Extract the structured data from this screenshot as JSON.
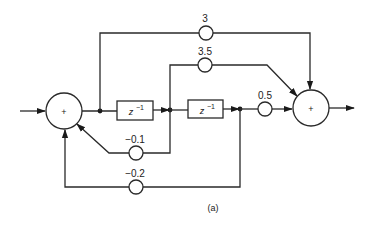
{
  "diagram": {
    "caption": "(a)",
    "summers": [
      {
        "id": "sum-left",
        "label": "+",
        "cx": 64,
        "cy": 111,
        "r": 18
      },
      {
        "id": "sum-right",
        "label": "+",
        "cx": 311,
        "cy": 108,
        "r": 18
      }
    ],
    "delays": [
      {
        "id": "delay-1",
        "label": "z",
        "exp": "−1",
        "x": 117,
        "y": 101,
        "w": 36,
        "h": 19
      },
      {
        "id": "delay-2",
        "label": "z",
        "exp": "−1",
        "x": 188,
        "y": 100,
        "w": 35,
        "h": 18
      }
    ],
    "gains": [
      {
        "id": "gain-3",
        "label": "3",
        "cx": 206,
        "cy": 33,
        "lx": 205,
        "ly": 22
      },
      {
        "id": "gain-3.5",
        "label": "3.5",
        "cx": 205,
        "cy": 65,
        "lx": 205,
        "ly": 54
      },
      {
        "id": "gain-0.5",
        "label": "0.5",
        "cx": 265,
        "cy": 109,
        "lx": 265,
        "ly": 98
      },
      {
        "id": "gain-neg0.1",
        "label": "−0.1",
        "cx": 136,
        "cy": 153,
        "lx": 135,
        "ly": 142
      },
      {
        "id": "gain-neg0.2",
        "label": "−0.2",
        "cx": 136,
        "cy": 187,
        "lx": 135,
        "ly": 176
      }
    ],
    "gain_radius": 7,
    "colors": {
      "stroke": "#2a2a2a",
      "background": "#ffffff"
    }
  }
}
